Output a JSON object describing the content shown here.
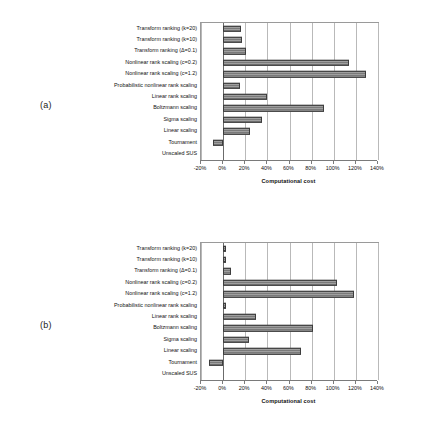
{
  "figures": [
    {
      "panel_label": "(a)",
      "chart_data": {
        "type": "bar",
        "orientation": "horizontal",
        "title": "",
        "xlabel": "Computational cost",
        "ylabel": "",
        "xlim": [
          -20,
          140
        ],
        "xticks": [
          -20,
          0,
          20,
          40,
          60,
          80,
          100,
          120,
          140
        ],
        "xtick_labels": [
          "-20%",
          "0%",
          "20%",
          "40%",
          "60%",
          "80%",
          "100%",
          "120%",
          "140%"
        ],
        "grid": true,
        "legend": "none",
        "categories": [
          "Transform ranking (k=20)",
          "Transform ranking (k=10)",
          "Transform ranking (Δ=0.1)",
          "Nonlinear rank scaling (c=0.2)",
          "Nonlinear rank scaling (c=1.2)",
          "Probabilistic nonlinear rank scaling",
          "Linear rank scaling",
          "Boltzmann scaling",
          "Sigma scaling",
          "Linear scaling",
          "Tournament",
          "Unscaled SUS"
        ],
        "values": [
          16,
          17,
          21,
          114,
          129,
          15,
          40,
          91,
          35,
          24,
          -9,
          0
        ]
      }
    },
    {
      "panel_label": "(b)",
      "chart_data": {
        "type": "bar",
        "orientation": "horizontal",
        "title": "",
        "xlabel": "Computational cost",
        "ylabel": "",
        "xlim": [
          -20,
          140
        ],
        "xticks": [
          -20,
          0,
          20,
          40,
          60,
          80,
          100,
          120,
          140
        ],
        "xtick_labels": [
          "-20%",
          "0%",
          "20%",
          "40%",
          "60%",
          "80%",
          "100%",
          "120%",
          "140%"
        ],
        "grid": true,
        "legend": "none",
        "categories": [
          "Transform ranking (k=20)",
          "Transform ranking (k=10)",
          "Transform ranking (Δ=0.1)",
          "Nonlinear rank scaling (c=0.2)",
          "Nonlinear rank scaling (c=1.2)",
          "Probabilistic nonlinear rank scaling",
          "Linear rank scaling",
          "Boltzmann scaling",
          "Sigma scaling",
          "Linear scaling",
          "Tournament",
          "Unscaled SUS"
        ],
        "values": [
          3,
          3,
          7,
          103,
          118,
          3,
          30,
          81,
          23,
          70,
          -13,
          0
        ]
      }
    }
  ]
}
